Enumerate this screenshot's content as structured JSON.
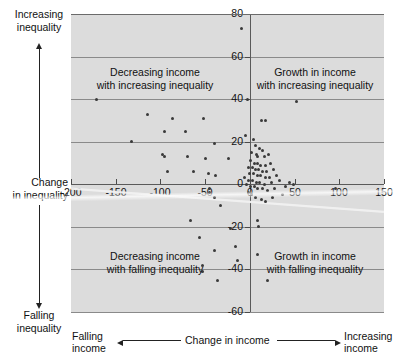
{
  "chart_data": {
    "type": "scatter",
    "title": "",
    "xlabel": "Change in income",
    "ylabel": "Change in inequality",
    "xlim": [
      -200,
      150
    ],
    "ylim": [
      -60,
      80
    ],
    "grid": true,
    "legend": "none",
    "x_ticks": [
      "-200",
      "-150",
      "-100",
      "-50",
      "0",
      "50",
      "100",
      "150"
    ],
    "x_tick_values": [
      -200,
      -150,
      -100,
      -50,
      0,
      50,
      100,
      150
    ],
    "y_ticks": [
      "80",
      "60",
      "40",
      "20",
      "0",
      "-20",
      "-40",
      "-60"
    ],
    "y_tick_values": [
      80,
      60,
      40,
      20,
      0,
      -20,
      -40,
      -60
    ],
    "annotations": [
      {
        "text": "Decreasing income with increasing inequality",
        "quadrant": "top-left"
      },
      {
        "text": "Growth in income with increasing inequality",
        "quadrant": "top-right"
      },
      {
        "text": "Decreasing income with falling inequality",
        "quadrant": "bottom-left"
      },
      {
        "text": "Growth in income with falling inequality",
        "quadrant": "bottom-right"
      }
    ],
    "points": [
      [
        -9,
        73
      ],
      [
        -172,
        40
      ],
      [
        -115,
        33
      ],
      [
        -86,
        31
      ],
      [
        -52,
        31
      ],
      [
        -96,
        25
      ],
      [
        -72,
        25
      ],
      [
        -132,
        20
      ],
      [
        -39,
        19
      ],
      [
        -98,
        14
      ],
      [
        -95,
        13
      ],
      [
        -70,
        13
      ],
      [
        -50,
        12
      ],
      [
        -24,
        12
      ],
      [
        -92,
        6
      ],
      [
        -63,
        6
      ],
      [
        -46,
        5
      ],
      [
        -38,
        4
      ],
      [
        -45,
        -2
      ],
      [
        -45,
        -4
      ],
      [
        -40,
        -6
      ],
      [
        -33,
        -10
      ],
      [
        -66,
        -17
      ],
      [
        -56,
        -25
      ],
      [
        -39,
        -31
      ],
      [
        -53,
        -38
      ],
      [
        -53,
        -41
      ],
      [
        -36,
        -45
      ],
      [
        -22,
        -21
      ],
      [
        -16,
        -29
      ],
      [
        -14,
        -36
      ],
      [
        -3,
        40
      ],
      [
        13,
        30
      ],
      [
        17,
        30
      ],
      [
        -5,
        23
      ],
      [
        4,
        21
      ],
      [
        6,
        18
      ],
      [
        11,
        17
      ],
      [
        14,
        16
      ],
      [
        2,
        15
      ],
      [
        7,
        14
      ],
      [
        9,
        13
      ],
      [
        16,
        13
      ],
      [
        21,
        14
      ],
      [
        1,
        11
      ],
      [
        5,
        10
      ],
      [
        8,
        10
      ],
      [
        12,
        9
      ],
      [
        18,
        9
      ],
      [
        23,
        10
      ],
      [
        -2,
        8
      ],
      [
        3,
        8
      ],
      [
        6,
        7
      ],
      [
        10,
        7
      ],
      [
        14,
        6
      ],
      [
        19,
        6
      ],
      [
        26,
        7
      ],
      [
        0,
        5
      ],
      [
        4,
        5
      ],
      [
        8,
        4
      ],
      [
        12,
        4
      ],
      [
        17,
        3
      ],
      [
        22,
        3
      ],
      [
        30,
        4
      ],
      [
        -6,
        3
      ],
      [
        -1,
        2
      ],
      [
        3,
        2
      ],
      [
        7,
        1
      ],
      [
        11,
        1
      ],
      [
        16,
        0
      ],
      [
        24,
        1
      ],
      [
        33,
        2
      ],
      [
        -4,
        0
      ],
      [
        1,
        -1
      ],
      [
        5,
        -1
      ],
      [
        9,
        -2
      ],
      [
        14,
        -2
      ],
      [
        20,
        -3
      ],
      [
        28,
        -2
      ],
      [
        40,
        -1
      ],
      [
        -2,
        -4
      ],
      [
        2,
        -5
      ],
      [
        6,
        -6
      ],
      [
        13,
        -7
      ],
      [
        18,
        -8
      ],
      [
        25,
        -6
      ],
      [
        36,
        -5
      ],
      [
        9,
        -17
      ],
      [
        10,
        -20
      ],
      [
        8,
        -33
      ],
      [
        20,
        -45
      ],
      [
        44,
        1
      ],
      [
        49,
        0
      ],
      [
        96,
        -2
      ],
      [
        52,
        39
      ]
    ],
    "trend_line": {
      "x1": -200,
      "y1": -2,
      "x2": 150,
      "y2": -13,
      "style": "light-grey-streak"
    }
  },
  "axis_annotations": {
    "y_top": "Increasing\ninequality",
    "y_top_line1": "Increasing",
    "y_top_line2": "inequality",
    "y_label_line1": "Change",
    "y_label_line2": "in inequality",
    "y_bottom_line1": "Falling",
    "y_bottom_line2": "inequality",
    "x_left_line1": "Falling",
    "x_left_line2": "income",
    "x_center": "Change in income",
    "x_right_line1": "Increasing",
    "x_right_line2": "income"
  },
  "quadrant_labels": {
    "top_left_line1": "Decreasing income",
    "top_left_line2": "with increasing inequality",
    "top_right_line1": "Growth in income",
    "top_right_line2": "with increasing inequality",
    "bottom_left_line1": "Decreasing income",
    "bottom_left_line2": "with falling inequality",
    "bottom_right_line1": "Growth in income",
    "bottom_right_line2": "with falling inequality"
  },
  "colors": {
    "plot_background": "#dcdcdc",
    "page_background": "#ffffff",
    "gridline": "#8a8a8a",
    "axis": "#5a5a5a",
    "point": "#3a3a3a",
    "text": "#111111"
  }
}
